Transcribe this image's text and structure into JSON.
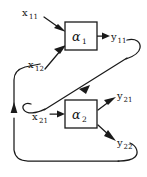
{
  "diagram": {
    "background_color": "#ffffff",
    "line_color": "#1a1a1a",
    "blocks": [
      {
        "id": "alpha1",
        "symbol": "α",
        "subscript": "1",
        "x": 65,
        "y": 22,
        "width": 32,
        "height": 28
      },
      {
        "id": "alpha2",
        "symbol": "α",
        "subscript": "2",
        "x": 65,
        "y": 100,
        "width": 32,
        "height": 28
      }
    ],
    "labels": [
      {
        "id": "x11",
        "base": "x",
        "subscript": "11",
        "x": 22,
        "y": 16
      },
      {
        "id": "x12",
        "base": "x",
        "subscript": "12",
        "x": 28,
        "y": 68
      },
      {
        "id": "x21",
        "base": "x",
        "subscript": "21",
        "x": 32,
        "y": 120
      },
      {
        "id": "y11",
        "base": "y",
        "subscript": "11",
        "x": 110,
        "y": 40
      },
      {
        "id": "y21",
        "base": "y",
        "subscript": "21",
        "x": 116,
        "y": 100
      },
      {
        "id": "y22",
        "base": "y",
        "subscript": "22",
        "x": 116,
        "y": 146
      }
    ],
    "connections": [
      {
        "id": "input-x11-to-alpha1",
        "from": "x11",
        "to": "alpha1",
        "style": "straight-arrow"
      },
      {
        "id": "input-x12-to-alpha1",
        "from": "x12",
        "to": "alpha1",
        "style": "straight-arrow"
      },
      {
        "id": "output-alpha1-y11",
        "from": "alpha1",
        "to": "y11",
        "style": "straight-arrow"
      },
      {
        "id": "feedback-y11-to-x21",
        "from": "y11",
        "to": "x21",
        "style": "hook-diagonal-arrow"
      },
      {
        "id": "input-x21-to-alpha2",
        "from": "x21",
        "to": "alpha2",
        "style": "straight-arrow"
      },
      {
        "id": "output-alpha2-y21",
        "from": "alpha2",
        "to": "y21",
        "style": "straight-arrow"
      },
      {
        "id": "output-alpha2-y22",
        "from": "alpha2",
        "to": "y22",
        "style": "straight-arrow"
      },
      {
        "id": "feedback-y22-to-x12",
        "from": "y22",
        "to": "x12",
        "style": "loop-left-arrow"
      }
    ]
  }
}
